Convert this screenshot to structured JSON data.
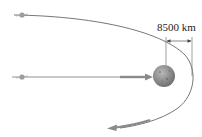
{
  "diagram": {
    "dimension_label": "8500 km",
    "elements": {
      "planet": {
        "name": "planet",
        "cx": 164,
        "cy": 76,
        "r": 11
      },
      "spacecraft_top": {
        "name": "spacecraft-initial",
        "x": 22,
        "y": 15
      },
      "spacecraft_bottom": {
        "name": "spacecraft-approach",
        "x": 22,
        "y": 77
      },
      "trajectory": {
        "name": "hyperbolic-trajectory",
        "closest_approach_x": 193
      }
    },
    "colors": {
      "line": "#666666",
      "arrow": "#8a8a8a",
      "planet": "#8c8c8c",
      "text": "#222222"
    }
  }
}
